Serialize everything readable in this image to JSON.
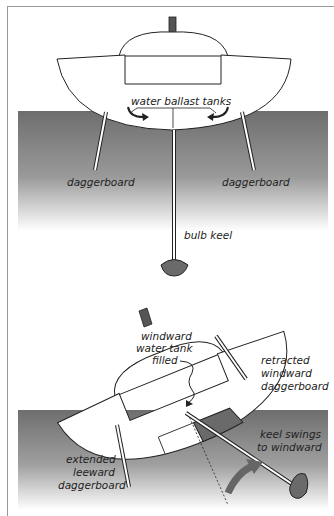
{
  "diagram": {
    "top": {
      "labels": {
        "tanks": "water ballast tanks",
        "dagger_left": "daggerboard",
        "dagger_right": "daggerboard",
        "keel": "bulb keel"
      }
    },
    "bottom": {
      "labels": {
        "tank_l1": "windward",
        "tank_l2": "water tank",
        "tank_l3": "filled",
        "retracted_l1": "retracted",
        "retracted_l2": "windward",
        "retracted_l3": "daggerboard",
        "extended_l1": "extended",
        "extended_l2": "leeward",
        "extended_l3": "daggerboard",
        "keel_l1": "keel swings",
        "keel_l2": "to windward"
      }
    },
    "colors": {
      "water_dark": "#6e6e6e",
      "water_light": "#ffffff",
      "hull": "#ffffff",
      "stroke": "#222222",
      "fill_dark": "#6a6a6a"
    }
  }
}
